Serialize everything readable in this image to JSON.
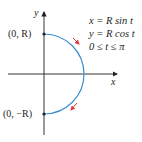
{
  "diagram": {
    "axes": {
      "x_label": "x",
      "y_label": "y"
    },
    "points": [
      {
        "label": "(0, R)",
        "x": 0,
        "y": "R"
      },
      {
        "label": "(0, −R)",
        "x": 0,
        "y": "-R"
      }
    ],
    "equations": [
      "x = R sin t",
      "y = R cos t",
      "0 ≤ t ≤ π"
    ],
    "curve": {
      "type": "semicircle",
      "side": "right",
      "direction": "clockwise",
      "color": "#3a8fd0"
    },
    "arrow_color": "#e03a3e",
    "axis_color": "#231f20"
  }
}
